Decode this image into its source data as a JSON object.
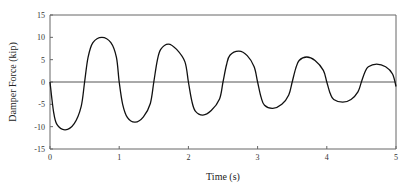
{
  "chart_data": {
    "type": "line",
    "title": "",
    "xlabel": "Time (s)",
    "ylabel": "Damper Force (kip)",
    "xlim": [
      0,
      5
    ],
    "ylim": [
      -15,
      15
    ],
    "xticks": [
      0,
      1,
      2,
      3,
      4,
      5
    ],
    "yticks": [
      15,
      10,
      5,
      0,
      -5,
      -10,
      -15
    ],
    "grid": false,
    "legend": null,
    "zero_line": true,
    "series": [
      {
        "name": "Damper Force",
        "color": "#111111",
        "x": [
          0,
          0.05,
          0.1,
          0.22,
          0.35,
          0.45,
          0.5,
          0.55,
          0.62,
          0.75,
          0.88,
          0.96,
          1.0,
          1.05,
          1.12,
          1.23,
          1.35,
          1.45,
          1.5,
          1.55,
          1.6,
          1.71,
          1.83,
          1.95,
          2.0,
          2.05,
          2.1,
          2.21,
          2.33,
          2.45,
          2.5,
          2.55,
          2.6,
          2.73,
          2.85,
          2.95,
          3.0,
          3.05,
          3.1,
          3.22,
          3.35,
          3.45,
          3.5,
          3.55,
          3.6,
          3.71,
          3.83,
          3.95,
          4.0,
          4.05,
          4.1,
          4.23,
          4.35,
          4.45,
          4.5,
          4.55,
          4.6,
          4.72,
          4.85,
          4.95,
          5.0
        ],
        "y": [
          0,
          -6.5,
          -9.5,
          -10.7,
          -9.3,
          -5.5,
          0,
          5.5,
          8.8,
          10.0,
          8.8,
          5.5,
          0,
          -5.0,
          -8.0,
          -9.0,
          -7.8,
          -4.8,
          0,
          4.8,
          7.3,
          8.5,
          7.3,
          4.5,
          0,
          -4.3,
          -6.5,
          -7.4,
          -6.4,
          -3.8,
          0,
          3.8,
          6.0,
          6.9,
          5.9,
          3.4,
          0,
          -3.4,
          -5.2,
          -5.9,
          -5.0,
          -2.9,
          0,
          3.0,
          4.8,
          5.6,
          4.8,
          2.6,
          0,
          -2.6,
          -3.9,
          -4.5,
          -3.9,
          -2.2,
          0,
          2.2,
          3.4,
          4.0,
          3.4,
          1.8,
          -1.0
        ]
      }
    ]
  }
}
